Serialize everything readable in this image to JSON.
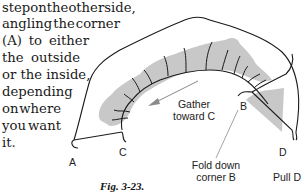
{
  "paragraph": {
    "lines": [
      [
        "step",
        "on",
        "the",
        "other",
        "side,"
      ],
      [
        "angling",
        "the",
        "corner"
      ],
      [
        "(A)",
        "to",
        "either"
      ],
      [
        "the",
        "outside"
      ],
      [
        "or the inside,"
      ],
      [
        "depending"
      ],
      [
        "on",
        "where"
      ],
      [
        "you",
        "want"
      ],
      [
        "it."
      ]
    ]
  },
  "figure": {
    "labels": {
      "a": "A",
      "b": "B",
      "c": "C",
      "d": "D",
      "gather_line1": "Gather",
      "gather_line2": "toward C",
      "fold_line1": "Fold down",
      "fold_line2": "corner B",
      "pull": "Pull D"
    },
    "caption": "Fig. 3-23.",
    "colors": {
      "fabric_shade": "#c8c8c8",
      "outline": "#1a1a1a",
      "arrow": "#8a8a8a"
    }
  }
}
